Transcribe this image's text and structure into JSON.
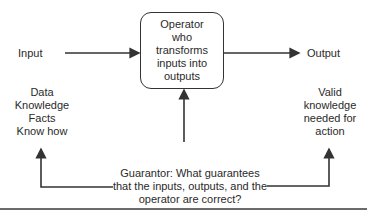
{
  "diagram": {
    "input_label": "Input",
    "output_label": "Output",
    "operator_lines": [
      "Operator",
      "who",
      "transforms",
      "inputs into",
      "outputs"
    ],
    "input_types": [
      "Data",
      "Knowledge",
      "Facts",
      "Know how"
    ],
    "output_types": [
      "Valid",
      "knowledge",
      "needed for",
      "action"
    ],
    "guarantor_lines": [
      "Guarantor: What guarantees",
      "that the inputs, outputs, and the",
      "operator are correct?"
    ],
    "colors": {
      "line": "#333333",
      "text": "#2a2a2a",
      "rule": "#6b6b6b"
    }
  }
}
